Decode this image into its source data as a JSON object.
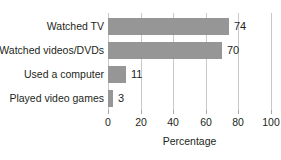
{
  "chart_data": {
    "type": "bar",
    "orientation": "horizontal",
    "title": "",
    "categories": [
      "Watched TV",
      "Watched videos/DVDs",
      "Used a computer",
      "Played video games"
    ],
    "values": [
      74,
      70,
      11,
      3
    ],
    "value_labels": [
      "74",
      "70",
      "11",
      "3"
    ],
    "xlabel": "Percentage",
    "ylabel": "",
    "xlim": [
      0,
      100
    ],
    "xticks": [
      0,
      20,
      40,
      60,
      80,
      100
    ],
    "xtick_labels": [
      "0",
      "20",
      "40",
      "60",
      "80",
      "100"
    ],
    "grid": true,
    "grid_axis": "x",
    "legend": false,
    "bar_color": "#969696",
    "grid_color": "#c9c9c9",
    "text_color": "#231f20"
  }
}
